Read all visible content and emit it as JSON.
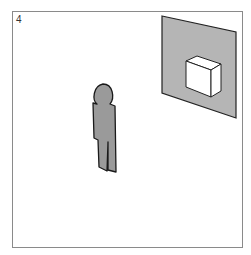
{
  "panel_number": "4",
  "scene": {
    "figure": "person-silhouette",
    "wall_panel": "gray-panel-with-box",
    "box": "white-3d-box"
  },
  "colors": {
    "panel": "#b5b5b5",
    "figure": "#9a9a9a",
    "outline": "#222222",
    "box": "#ffffff",
    "frame": "#8a8a8a"
  }
}
